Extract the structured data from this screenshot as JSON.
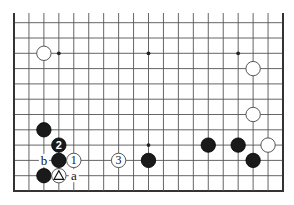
{
  "diagram": {
    "type": "go-board-fragment",
    "board_size": 19,
    "visible_rows_from_bottom": 12,
    "colors": {
      "background": "#ffffff",
      "black_stone": "#1a1a1a",
      "white_stone": "#ffffff",
      "grid": "#555555"
    },
    "star_points": [
      {
        "col": 3,
        "row": 9
      },
      {
        "col": 9,
        "row": 9
      },
      {
        "col": 15,
        "row": 9
      },
      {
        "col": 9,
        "row": 3
      }
    ],
    "stones": [
      {
        "color": "white",
        "col": 2,
        "row": 9,
        "label": ""
      },
      {
        "color": "white",
        "col": 16,
        "row": 8,
        "label": ""
      },
      {
        "color": "white",
        "col": 16,
        "row": 5,
        "label": ""
      },
      {
        "color": "black",
        "col": 2,
        "row": 4,
        "label": ""
      },
      {
        "color": "black",
        "col": 3,
        "row": 3,
        "label": "2"
      },
      {
        "color": "black",
        "col": 13,
        "row": 3,
        "label": ""
      },
      {
        "color": "black",
        "col": 15,
        "row": 3,
        "label": ""
      },
      {
        "color": "white",
        "col": 17,
        "row": 3,
        "label": ""
      },
      {
        "color": "black",
        "col": 3,
        "row": 2,
        "label": ""
      },
      {
        "color": "white",
        "col": 4,
        "row": 2,
        "label": "1"
      },
      {
        "color": "white",
        "col": 7,
        "row": 2,
        "label": "3"
      },
      {
        "color": "black",
        "col": 9,
        "row": 2,
        "label": ""
      },
      {
        "color": "black",
        "col": 16,
        "row": 2,
        "label": ""
      },
      {
        "color": "black",
        "col": 2,
        "row": 1,
        "label": ""
      },
      {
        "color": "white",
        "col": 3,
        "row": 1,
        "label": "",
        "marker": "triangle"
      }
    ],
    "letters": [
      {
        "text": "b",
        "col": 2,
        "row": 2
      },
      {
        "text": "a",
        "col": 4,
        "row": 1
      }
    ]
  }
}
